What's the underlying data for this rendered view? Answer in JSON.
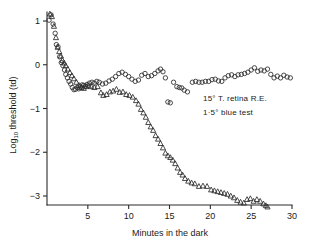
{
  "chart_data": {
    "type": "scatter",
    "title": "",
    "xlabel": "Minutes in the dark",
    "ylabel": "Log10 threshold (td)",
    "ylabel_main": "Log",
    "ylabel_sub": "10",
    "ylabel_rest": " threshold (td)",
    "xlim": [
      0,
      30
    ],
    "ylim": [
      -3.45,
      1.35
    ],
    "xticks": [
      5,
      10,
      15,
      20,
      25,
      30
    ],
    "xtick_labels": [
      "5",
      "10",
      "15",
      "20",
      "25",
      "30"
    ],
    "yticks": [
      1,
      0,
      -1,
      -2,
      -3
    ],
    "ytick_labels": [
      "1",
      "0",
      "−1",
      "−2",
      "−3"
    ],
    "grid": false,
    "legend_position": "inside-right",
    "annotations": [
      "15° T. retina R.E.",
      "1·5° blue test"
    ],
    "marker_color": "#2b2b2b",
    "axis_color": "#2b2b2b",
    "background_color": "#ffffff",
    "series": [
      {
        "name": "cone-branch-circles",
        "marker": "circle",
        "points": [
          [
            0.25,
            1.02
          ],
          [
            0.5,
            1.14
          ],
          [
            0.75,
            0.93
          ],
          [
            1.0,
            0.72
          ],
          [
            1.15,
            0.46
          ],
          [
            1.35,
            0.41
          ],
          [
            1.55,
            0.18
          ],
          [
            1.75,
            0.05
          ],
          [
            1.95,
            -0.02
          ],
          [
            2.15,
            -0.12
          ],
          [
            2.3,
            -0.22
          ],
          [
            2.5,
            -0.3
          ],
          [
            2.7,
            -0.38
          ],
          [
            2.9,
            -0.44
          ],
          [
            3.1,
            -0.52
          ],
          [
            3.3,
            -0.57
          ],
          [
            3.5,
            -0.56
          ],
          [
            3.7,
            -0.52
          ],
          [
            3.9,
            -0.55
          ],
          [
            4.1,
            -0.5
          ],
          [
            4.3,
            -0.46
          ],
          [
            4.5,
            -0.47
          ],
          [
            4.7,
            -0.49
          ],
          [
            4.9,
            -0.45
          ],
          [
            5.2,
            -0.42
          ],
          [
            5.5,
            -0.4
          ],
          [
            5.8,
            -0.42
          ],
          [
            6.1,
            -0.38
          ],
          [
            6.4,
            -0.4
          ],
          [
            6.8,
            -0.44
          ],
          [
            7.2,
            -0.42
          ],
          [
            7.6,
            -0.37
          ],
          [
            8.0,
            -0.33
          ],
          [
            8.4,
            -0.27
          ],
          [
            8.8,
            -0.2
          ],
          [
            9.2,
            -0.17
          ],
          [
            9.6,
            -0.22
          ],
          [
            10.0,
            -0.27
          ],
          [
            10.4,
            -0.33
          ],
          [
            10.8,
            -0.38
          ],
          [
            11.2,
            -0.35
          ],
          [
            11.6,
            -0.24
          ],
          [
            12.0,
            -0.2
          ],
          [
            12.4,
            -0.27
          ],
          [
            12.8,
            -0.25
          ],
          [
            13.2,
            -0.2
          ],
          [
            13.6,
            -0.14
          ],
          [
            13.9,
            -0.1
          ],
          [
            14.2,
            -0.16
          ],
          [
            14.5,
            -0.3
          ],
          [
            14.8,
            -0.85
          ],
          [
            15.1,
            -0.87
          ],
          [
            15.5,
            -0.4
          ],
          [
            15.9,
            -0.5
          ],
          [
            16.2,
            -0.52
          ],
          [
            16.5,
            -0.53
          ],
          [
            16.8,
            -0.58
          ],
          [
            17.2,
            -0.62
          ],
          [
            17.8,
            -0.4
          ],
          [
            18.2,
            -0.38
          ],
          [
            18.6,
            -0.4
          ],
          [
            19.0,
            -0.4
          ],
          [
            19.4,
            -0.38
          ],
          [
            19.8,
            -0.38
          ],
          [
            20.2,
            -0.34
          ],
          [
            20.6,
            -0.33
          ],
          [
            21.0,
            -0.37
          ],
          [
            21.4,
            -0.38
          ],
          [
            21.8,
            -0.3
          ],
          [
            22.2,
            -0.25
          ],
          [
            22.6,
            -0.23
          ],
          [
            23.0,
            -0.27
          ],
          [
            23.4,
            -0.23
          ],
          [
            23.8,
            -0.22
          ],
          [
            24.2,
            -0.2
          ],
          [
            24.6,
            -0.17
          ],
          [
            25.0,
            -0.12
          ],
          [
            25.4,
            -0.07
          ],
          [
            25.8,
            -0.15
          ],
          [
            26.2,
            -0.12
          ],
          [
            26.6,
            -0.14
          ],
          [
            27.0,
            -0.1
          ],
          [
            27.4,
            -0.22
          ],
          [
            27.8,
            -0.3
          ],
          [
            28.2,
            -0.26
          ],
          [
            28.6,
            -0.3
          ],
          [
            29.0,
            -0.24
          ],
          [
            29.4,
            -0.28
          ],
          [
            29.8,
            -0.3
          ]
        ]
      },
      {
        "name": "rod-branch-triangles",
        "marker": "triangle",
        "points": [
          [
            0.35,
            1.16
          ],
          [
            0.6,
            1.1
          ],
          [
            0.85,
            0.88
          ],
          [
            1.1,
            0.62
          ],
          [
            1.3,
            0.4
          ],
          [
            1.5,
            0.3
          ],
          [
            1.7,
            0.2
          ],
          [
            1.9,
            0.1
          ],
          [
            2.1,
            0.04
          ],
          [
            2.3,
            -0.02
          ],
          [
            2.55,
            -0.1
          ],
          [
            2.8,
            -0.18
          ],
          [
            3.05,
            -0.25
          ],
          [
            3.3,
            -0.32
          ],
          [
            3.6,
            -0.4
          ],
          [
            3.9,
            -0.47
          ],
          [
            4.2,
            -0.52
          ],
          [
            4.5,
            -0.54
          ],
          [
            4.8,
            -0.5
          ],
          [
            5.1,
            -0.48
          ],
          [
            5.4,
            -0.5
          ],
          [
            5.8,
            -0.52
          ],
          [
            6.2,
            -0.5
          ],
          [
            6.6,
            -0.64
          ],
          [
            6.9,
            -0.7
          ],
          [
            7.3,
            -0.68
          ],
          [
            7.7,
            -0.62
          ],
          [
            8.1,
            -0.6
          ],
          [
            8.5,
            -0.56
          ],
          [
            8.9,
            -0.63
          ],
          [
            9.3,
            -0.62
          ],
          [
            9.7,
            -0.68
          ],
          [
            10.1,
            -0.7
          ],
          [
            10.5,
            -0.74
          ],
          [
            10.9,
            -0.82
          ],
          [
            11.2,
            -0.9
          ],
          [
            11.5,
            -1.02
          ],
          [
            11.8,
            -1.1
          ],
          [
            12.1,
            -1.2
          ],
          [
            12.4,
            -1.32
          ],
          [
            12.7,
            -1.42
          ],
          [
            13.0,
            -1.5
          ],
          [
            13.3,
            -1.62
          ],
          [
            13.6,
            -1.7
          ],
          [
            13.9,
            -1.8
          ],
          [
            14.2,
            -1.9
          ],
          [
            14.5,
            -2.02
          ],
          [
            14.8,
            -2.08
          ],
          [
            15.1,
            -2.12
          ],
          [
            15.4,
            -2.18
          ],
          [
            15.7,
            -2.26
          ],
          [
            16.0,
            -2.36
          ],
          [
            16.3,
            -2.46
          ],
          [
            16.6,
            -2.52
          ],
          [
            16.9,
            -2.6
          ],
          [
            17.3,
            -2.66
          ],
          [
            17.7,
            -2.7
          ],
          [
            18.1,
            -2.72
          ],
          [
            18.6,
            -2.78
          ],
          [
            19.1,
            -2.77
          ],
          [
            19.6,
            -2.78
          ],
          [
            20.1,
            -2.86
          ],
          [
            20.5,
            -2.88
          ],
          [
            20.9,
            -2.9
          ],
          [
            21.3,
            -2.92
          ],
          [
            21.7,
            -2.94
          ],
          [
            22.1,
            -2.96
          ],
          [
            22.5,
            -3.0
          ],
          [
            22.9,
            -3.04
          ],
          [
            23.3,
            -3.1
          ],
          [
            23.7,
            -3.14
          ],
          [
            24.1,
            -3.16
          ],
          [
            24.5,
            -3.08
          ],
          [
            24.9,
            -3.06
          ],
          [
            25.3,
            -3.12
          ],
          [
            25.7,
            -3.08
          ],
          [
            26.1,
            -3.12
          ],
          [
            26.5,
            -3.18
          ],
          [
            26.8,
            -3.22
          ],
          [
            27.0,
            -3.25
          ]
        ]
      }
    ]
  }
}
